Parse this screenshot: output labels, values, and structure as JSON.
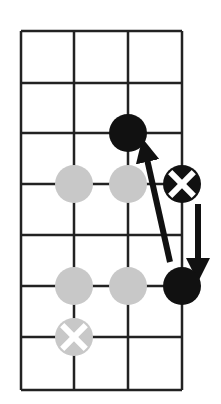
{
  "diagram": {
    "type": "go-board-fragment",
    "grid": {
      "columns": 4,
      "rows": 8,
      "x_lines": [
        21,
        74,
        128,
        182
      ],
      "y_lines": [
        31,
        83,
        133,
        184,
        235,
        286,
        337,
        390
      ],
      "line_color": "#222222",
      "line_width": 2.5
    },
    "stones": [
      {
        "name": "black-stone",
        "x": 128,
        "y": 133,
        "color": "black",
        "marked": false
      },
      {
        "name": "gray-stone",
        "x": 74,
        "y": 184,
        "color": "gray",
        "marked": false
      },
      {
        "name": "gray-stone",
        "x": 128,
        "y": 184,
        "color": "gray",
        "marked": false
      },
      {
        "name": "black-stone-x-marked",
        "x": 182,
        "y": 184,
        "color": "black",
        "marked": true
      },
      {
        "name": "gray-stone",
        "x": 74,
        "y": 286,
        "color": "gray",
        "marked": false
      },
      {
        "name": "gray-stone",
        "x": 128,
        "y": 286,
        "color": "gray",
        "marked": false
      },
      {
        "name": "black-stone",
        "x": 182,
        "y": 286,
        "color": "black",
        "marked": false
      },
      {
        "name": "gray-stone-x-marked",
        "x": 74,
        "y": 337,
        "color": "gray",
        "marked": true
      }
    ],
    "arrows": [
      {
        "name": "arrow-diagonal-up",
        "x1": 170,
        "y1": 262,
        "x2": 145,
        "y2": 150
      },
      {
        "name": "arrow-down",
        "x1": 198,
        "y1": 204,
        "x2": 198,
        "y2": 270
      }
    ],
    "colors": {
      "black": "#111111",
      "gray": "#c8c8c8",
      "mark": "#ffffff",
      "background": "#ffffff"
    },
    "stone_radius": 19
  }
}
